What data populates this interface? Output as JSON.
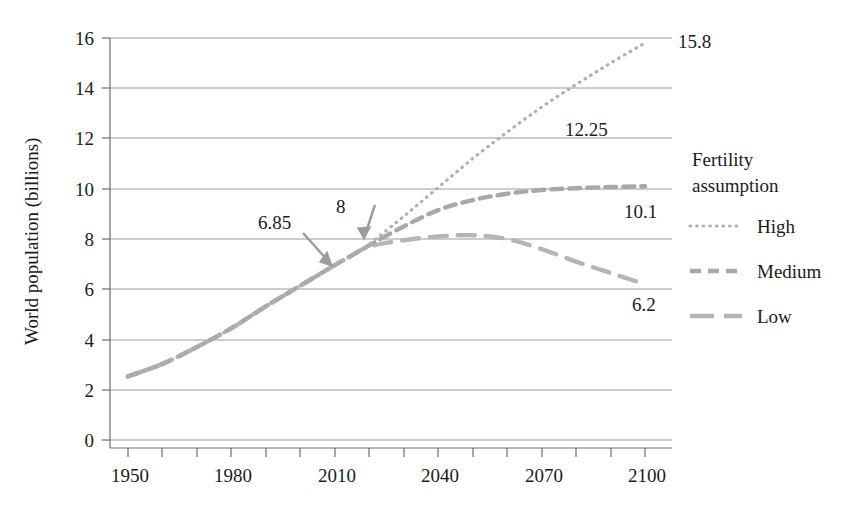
{
  "chart_data": {
    "type": "line",
    "title": "",
    "xlabel": "",
    "ylabel": "World population (billions)",
    "xlim": [
      1950,
      2100
    ],
    "ylim": [
      0,
      16
    ],
    "x_ticks": [
      1950,
      1980,
      2010,
      2040,
      2070,
      2100
    ],
    "x_tick_labels": [
      "1950",
      "1980",
      "2010",
      "2040",
      "2070",
      "2100"
    ],
    "x_minor_tick_step": 10,
    "y_ticks": [
      0,
      2,
      4,
      6,
      8,
      10,
      12,
      14,
      16
    ],
    "y_tick_labels": [
      "0",
      "2",
      "4",
      "6",
      "8",
      "10",
      "12",
      "14",
      "16"
    ],
    "grid": "horizontal",
    "legend_position": "right",
    "legend_title": "Fertility assumption",
    "series": [
      {
        "name": "High",
        "style": "dotted",
        "color": "#b0b0b0",
        "x": [
          1950,
          1960,
          1970,
          1980,
          1990,
          2000,
          2010,
          2015,
          2020,
          2030,
          2040,
          2050,
          2060,
          2070,
          2080,
          2090,
          2100
        ],
        "values": [
          2.53,
          3.03,
          3.7,
          4.45,
          5.32,
          6.14,
          6.96,
          7.35,
          7.8,
          8.9,
          10.05,
          11.2,
          12.25,
          13.25,
          14.15,
          15.0,
          15.8
        ]
      },
      {
        "name": "Medium",
        "style": "dashed",
        "color": "#a8a8a8",
        "x": [
          1950,
          1960,
          1970,
          1980,
          1990,
          2000,
          2010,
          2015,
          2020,
          2030,
          2040,
          2050,
          2060,
          2070,
          2080,
          2090,
          2100
        ],
        "values": [
          2.53,
          3.03,
          3.7,
          4.45,
          5.32,
          6.14,
          6.96,
          7.35,
          7.75,
          8.5,
          9.15,
          9.55,
          9.8,
          9.95,
          10.02,
          10.07,
          10.1
        ]
      },
      {
        "name": "Low",
        "style": "long-dash",
        "color": "#b5b5b5",
        "x": [
          1950,
          1960,
          1970,
          1980,
          1990,
          2000,
          2010,
          2015,
          2020,
          2030,
          2040,
          2050,
          2060,
          2070,
          2080,
          2090,
          2100
        ],
        "values": [
          2.53,
          3.03,
          3.7,
          4.45,
          5.32,
          6.14,
          6.96,
          7.35,
          7.7,
          7.95,
          8.1,
          8.15,
          8.0,
          7.6,
          7.1,
          6.65,
          6.2
        ]
      }
    ],
    "annotations": [
      {
        "text": "6.85",
        "points_to_year": 2010,
        "points_to_value": 6.85
      },
      {
        "text": "8",
        "points_to_year": 2020,
        "points_to_value": 8.0
      }
    ],
    "end_labels": [
      {
        "text": "15.8",
        "series": "High",
        "value": 15.8
      },
      {
        "text": "12.25",
        "series": "High",
        "value": 12.25
      },
      {
        "text": "10.1",
        "series": "Medium",
        "value": 10.1
      },
      {
        "text": "6.2",
        "series": "Low",
        "value": 6.2
      }
    ]
  },
  "legend": {
    "title_line1": "Fertility",
    "title_line2": "assumption",
    "items": [
      {
        "label": "High",
        "style": "dotted"
      },
      {
        "label": "Medium",
        "style": "dashed"
      },
      {
        "label": "Low",
        "style": "long-dash"
      }
    ]
  },
  "colors": {
    "axis": "#6e6e6e",
    "grid": "#9a9a9a",
    "text": "#1b1b1b",
    "series_high": "#b0b0b0",
    "series_medium": "#a8a8a8",
    "series_low": "#b5b5b5",
    "annotation_arrow": "#9c9c9c"
  }
}
